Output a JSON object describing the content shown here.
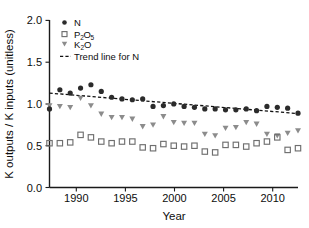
{
  "chart_data": {
    "type": "scatter",
    "title": "",
    "xlabel": "Year",
    "ylabel": "K outputs / K inputs (unitless)",
    "xlim": [
      1988,
      2012
    ],
    "ylim": [
      0.0,
      2.0
    ],
    "xticks": [
      1990,
      1995,
      2000,
      2005,
      2010
    ],
    "xtick_labels": [
      "1990",
      "1995",
      "2000",
      "2005",
      "2010"
    ],
    "yticks": [
      0.0,
      0.5,
      1.0,
      1.5,
      2.0
    ],
    "ytick_labels": [
      "0.0",
      "0.5",
      "1.0",
      "1.5",
      "2.0"
    ],
    "grid": false,
    "legend_position": "top-left",
    "x": [
      1988,
      1989,
      1990,
      1991,
      1992,
      1993,
      1994,
      1995,
      1996,
      1997,
      1998,
      1999,
      2000,
      2001,
      2002,
      2003,
      2004,
      2005,
      2006,
      2007,
      2008,
      2009,
      2010,
      2011,
      2012
    ],
    "series": [
      {
        "name": "N",
        "marker": "filled-circle",
        "color": "#2b2b2b",
        "values": [
          0.94,
          1.17,
          1.13,
          1.19,
          1.23,
          1.15,
          1.08,
          1.06,
          1.05,
          1.06,
          0.97,
          0.98,
          1.0,
          0.97,
          0.96,
          0.94,
          0.94,
          0.93,
          0.93,
          0.94,
          0.92,
          0.97,
          0.96,
          0.95,
          0.89
        ]
      },
      {
        "name": "P2O5",
        "label_main": "P",
        "label_sub1": "2",
        "label_main2": "O",
        "label_sub2": "5",
        "marker": "open-square",
        "color": "#6f6f6f",
        "values": [
          0.53,
          0.53,
          0.54,
          0.63,
          0.6,
          0.55,
          0.53,
          0.55,
          0.55,
          0.48,
          0.47,
          0.52,
          0.5,
          0.49,
          0.5,
          0.43,
          0.42,
          0.51,
          0.51,
          0.49,
          0.53,
          0.55,
          0.6,
          0.45,
          0.47
        ]
      },
      {
        "name": "K2O",
        "label_main": "K",
        "label_sub1": "2",
        "label_main2": "O",
        "marker": "filled-triangle-down",
        "color": "#8c8c8c",
        "values": [
          0.98,
          0.97,
          0.96,
          1.07,
          0.98,
          0.88,
          0.84,
          0.84,
          0.82,
          0.73,
          0.75,
          0.85,
          0.78,
          0.77,
          0.77,
          0.64,
          0.62,
          0.71,
          0.72,
          0.78,
          0.76,
          0.64,
          0.62,
          0.65,
          0.68
        ]
      }
    ],
    "trendline": {
      "name": "Trend line for N",
      "style": "dashed",
      "color": "#111111",
      "x_start": 1988,
      "y_start": 1.13,
      "x_end": 2012,
      "y_end": 0.885
    },
    "legend_entries": [
      {
        "key": "N",
        "marker": "filled-circle"
      },
      {
        "key": "P2O5",
        "marker": "open-square"
      },
      {
        "key": "K2O",
        "marker": "filled-triangle-down"
      },
      {
        "key": "trend",
        "marker": "dashed-line"
      }
    ]
  },
  "legend": {
    "n_label": "N",
    "p_label_main": "P",
    "p_label_sub": "2",
    "p_label_o": "O",
    "p_label_sub2": "5",
    "k_label_main": "K",
    "k_label_sub": "2",
    "k_label_o": "O",
    "trend_label": "Trend line for N"
  },
  "axes": {
    "x_title": "Year",
    "y_title": "K outputs / K inputs (unitless)"
  }
}
